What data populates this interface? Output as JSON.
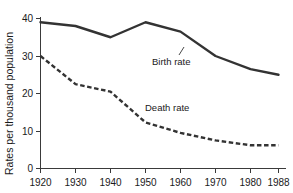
{
  "chart_data": {
    "type": "line",
    "title": "",
    "xlabel": "",
    "ylabel": "Rates per thousand population",
    "x": [
      1920,
      1930,
      1940,
      1950,
      1960,
      1970,
      1980,
      1988
    ],
    "xtick_labels": [
      "1920",
      "1930",
      "1940",
      "1950",
      "1960",
      "1970",
      "1980",
      "1988"
    ],
    "ytick_labels": [
      "0",
      "10",
      "20",
      "30",
      "40"
    ],
    "yticks": [
      0,
      10,
      20,
      30,
      40
    ],
    "ylim": [
      0,
      40
    ],
    "xlim": [
      1920,
      1988
    ],
    "grid": false,
    "legend_position": "inline-annotations",
    "series": [
      {
        "name": "Birth rate",
        "label": "Birth rate",
        "style": "solid",
        "color": "#333333",
        "values": [
          39,
          38,
          35,
          39,
          36.5,
          30,
          26.5,
          25
        ]
      },
      {
        "name": "Death rate",
        "label": "Death rate",
        "style": "dashed",
        "color": "#333333",
        "values": [
          30,
          22.5,
          20.5,
          12.3,
          9.5,
          7.5,
          6.2,
          6.2
        ]
      }
    ],
    "annotations": [
      {
        "text": "Birth rate",
        "series": "Birth rate"
      },
      {
        "text": "Death rate",
        "series": "Death rate"
      }
    ]
  },
  "axis": {
    "y_title": "Rates per thousand population",
    "y_ticks": [
      "0",
      "10",
      "20",
      "30",
      "40"
    ],
    "x_ticks": [
      "1920",
      "1930",
      "1940",
      "1950",
      "1960",
      "1970",
      "1980",
      "1988"
    ]
  },
  "labels": {
    "birth_rate": "Birth rate",
    "death_rate": "Death rate"
  },
  "colors": {
    "line": "#333333",
    "axis": "#3a3a3a",
    "text": "#1a1a1a",
    "background": "#ffffff"
  }
}
